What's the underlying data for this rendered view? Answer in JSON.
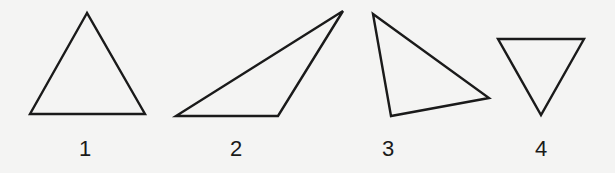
{
  "figure": {
    "stroke_color": "#1a1a1a",
    "background": "#f4f4f3",
    "triangles": [
      {
        "label": "1",
        "type": "equilateral-upright",
        "points": "87,13 30,114 145,114",
        "label_x": 85,
        "label_y": 138
      },
      {
        "label": "2",
        "type": "obtuse",
        "points": "176,116 278,116 343,11",
        "label_x": 236,
        "label_y": 138
      },
      {
        "label": "3",
        "type": "right-tilted",
        "points": "373,14 391,116 489,98",
        "label_x": 388,
        "label_y": 138
      },
      {
        "label": "4",
        "type": "equilateral-inverted",
        "points": "498,39 584,39 541,115",
        "label_x": 541,
        "label_y": 138
      }
    ]
  }
}
